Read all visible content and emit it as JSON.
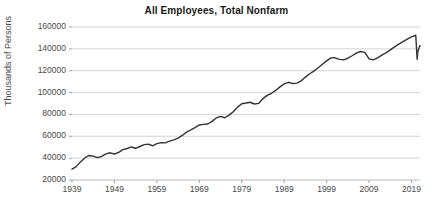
{
  "chart_data": {
    "type": "line",
    "title": "All Employees, Total Nonfarm",
    "xlabel": "",
    "ylabel": "Thousands of Persons",
    "ylim": [
      20000,
      160000
    ],
    "xlim": [
      1939,
      2021
    ],
    "yticks": [
      20000,
      40000,
      60000,
      80000,
      100000,
      120000,
      140000,
      160000
    ],
    "ytick_labels": [
      "20000",
      "40000",
      "60000",
      "80000",
      "100000",
      "120000",
      "140000",
      "160000"
    ],
    "xticks": [
      1939,
      1949,
      1959,
      1969,
      1979,
      1989,
      1999,
      2009,
      2019
    ],
    "xtick_labels": [
      "1939",
      "1949",
      "1959",
      "1969",
      "1979",
      "1989",
      "1999",
      "2009",
      "2019"
    ],
    "grid": "horizontal",
    "legend": null,
    "line_color": "#333333",
    "line_width": 1.4,
    "series": [
      {
        "name": "All Employees, Total Nonfarm",
        "x": [
          1939,
          1940,
          1941,
          1942,
          1943,
          1944,
          1945,
          1946,
          1947,
          1948,
          1949,
          1950,
          1951,
          1952,
          1953,
          1954,
          1955,
          1956,
          1957,
          1958,
          1959,
          1960,
          1961,
          1962,
          1963,
          1964,
          1965,
          1966,
          1967,
          1968,
          1969,
          1970,
          1971,
          1972,
          1973,
          1974,
          1975,
          1976,
          1977,
          1978,
          1979,
          1980,
          1981,
          1982,
          1983,
          1984,
          1985,
          1986,
          1987,
          1988,
          1989,
          1990,
          1991,
          1992,
          1993,
          1994,
          1995,
          1996,
          1997,
          1998,
          1999,
          2000,
          2001,
          2002,
          2003,
          2004,
          2005,
          2006,
          2007,
          2008,
          2009,
          2010,
          2011,
          2012,
          2013,
          2014,
          2015,
          2016,
          2017,
          2018,
          2019,
          2020.0,
          2020.33,
          2020.5,
          2021.0
        ],
        "values": [
          29923,
          32220,
          36562,
          40136,
          42452,
          41883,
          40394,
          41674,
          43881,
          44891,
          43778,
          45222,
          47849,
          48825,
          50232,
          49022,
          50641,
          52369,
          52853,
          51324,
          53268,
          54189,
          53999,
          55549,
          56653,
          58283,
          60765,
          63901,
          65803,
          67897,
          70384,
          70880,
          71214,
          73675,
          76790,
          78265,
          76945,
          79382,
          82471,
          86697,
          89823,
          90406,
          91152,
          89544,
          90152,
          94408,
          97387,
          99344,
          101958,
          105210,
          107895,
          109419,
          108256,
          108604,
          110713,
          114163,
          117191,
          119608,
          122690,
          125865,
          128993,
          131785,
          131826,
          130341,
          129999,
          131435,
          133703,
          136086,
          137598,
          136790,
          130807,
          129900,
          131821,
          134174,
          136387,
          139043,
          141830,
          144349,
          146608,
          148898,
          150904,
          152463,
          130421,
          137802,
          143000
        ]
      }
    ],
    "annotations": []
  }
}
